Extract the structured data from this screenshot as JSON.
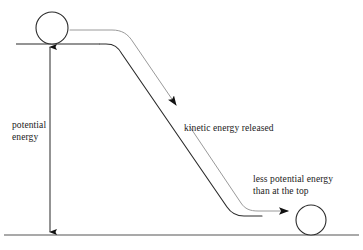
{
  "diagram": {
    "colors": {
      "ink": "#1a1a1a",
      "ramp": "#2b2b2b",
      "ground": "#555555",
      "path": "#9a9a9a",
      "arrow": "#111111",
      "background": "#ffffff"
    },
    "labels": {
      "potential_energy": "potential\nenergy",
      "kinetic_energy_released": "kinetic energy released",
      "less_potential_energy": "less potential energy\nthan at the top"
    },
    "elements": {
      "top_ball": {
        "name": "ball-at-top",
        "cx": 52,
        "cy": 28,
        "r": 16
      },
      "bottom_ball": {
        "name": "ball-at-bottom",
        "cx": 311,
        "cy": 220,
        "r": 15
      },
      "top_surface_line": {
        "x1": 16,
        "y1": 44,
        "x2": 96,
        "y2": 44
      },
      "ground_line": {
        "x1": 4,
        "y1": 235,
        "x2": 359,
        "y2": 235
      },
      "height_arrow": {
        "x": 50,
        "y_top": 45,
        "y_bottom": 234,
        "double_headed": true
      },
      "ramp_path": "top plateau, curved descent, bottom runout",
      "motion_path": "gray guide path following the ramp with arrowheads"
    }
  }
}
